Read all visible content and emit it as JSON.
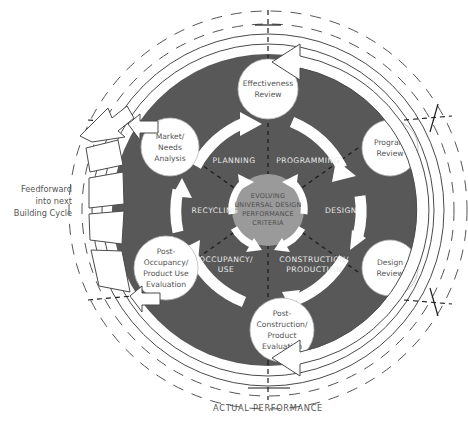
{
  "diagram": {
    "colors": {
      "ring_dark": "#585858",
      "core_gray": "#9a9a9a",
      "node_fill": "#ffffff",
      "outline": "#4a4a4a",
      "sector_text": "#e9e9e9",
      "node_text": "#545454",
      "background": "#ffffff"
    },
    "core": {
      "name": "core-label",
      "lines": [
        "EVOLVING",
        "UNIVERSAL DESIGN",
        "PERFORMANCE",
        "CRITERIA"
      ]
    },
    "sectors": [
      {
        "id": "planning",
        "label": "PLANNING",
        "lines": [
          "PLANNING"
        ]
      },
      {
        "id": "programming",
        "label": "PROGRAMMING",
        "lines": [
          "PROGRAMMING"
        ]
      },
      {
        "id": "design",
        "label": "DESIGN",
        "lines": [
          "DESIGN"
        ]
      },
      {
        "id": "construction",
        "label": "CONSTRUCTION/ PRODUCTION",
        "lines": [
          "CONSTRUCTION/",
          "PRODUCTION"
        ]
      },
      {
        "id": "occupancy",
        "label": "OCCUPANCY/ USE",
        "lines": [
          "OCCUPANCY/",
          "USE"
        ]
      },
      {
        "id": "recycling",
        "label": "RECYCLING",
        "lines": [
          "RECYCLING"
        ]
      }
    ],
    "nodes": [
      {
        "id": "effectiveness-review",
        "label": "Effectiveness Review",
        "lines": [
          "Effectiveness",
          "Review"
        ]
      },
      {
        "id": "program-review",
        "label": "Program Review",
        "lines": [
          "Program",
          "Review"
        ]
      },
      {
        "id": "design-review",
        "label": "Design Review",
        "lines": [
          "Design",
          "Review"
        ]
      },
      {
        "id": "post-construction",
        "label": "Post-Construction/ Product Evaluation",
        "lines": [
          "Post-",
          "Construction/",
          "Product",
          "Evaluation"
        ]
      },
      {
        "id": "post-occupancy",
        "label": "Post-Occupancy/ Product Use Evaluation",
        "lines": [
          "Post-",
          "Occupancy/",
          "Product Use",
          "Evaluation"
        ]
      },
      {
        "id": "market-needs",
        "label": "Market/ Needs Analysis",
        "lines": [
          "Market/",
          "Needs",
          "Analysis"
        ]
      }
    ],
    "annotations": {
      "feedforward": {
        "lines": [
          "Feedforward",
          "into next",
          "Building Cycle"
        ]
      },
      "actual_performance": "ACTUAL PERFORMANCE"
    }
  }
}
